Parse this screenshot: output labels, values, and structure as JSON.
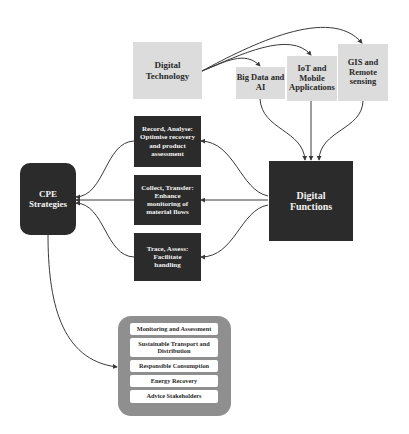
{
  "diagram": {
    "digital_technology": "Digital Technology",
    "technologies": [
      "Big Data and AI",
      "IoT and Mobile Applications",
      "GIS and Remote sensing"
    ],
    "digital_functions": "Digital Functions",
    "functions": [
      "Record, Analyse: Optimise recovery and product assessment",
      "Collect, Transfer: Enhance monitoring of material flows",
      "Trace, Assess: Facilitate handling"
    ],
    "cpe_strategies": "CPE Strategies",
    "strategies": [
      "Monitoring and Assessment",
      "Sustainable Transport and Distribution",
      "Responsible Consumption",
      "Energy Recovery",
      "Advice Stakeholders"
    ],
    "colors": {
      "light_box": "#dcdcdc",
      "dark_box": "#2b2b2b",
      "container": "#8f8f8f",
      "arrow": "#3a3a3a"
    }
  }
}
